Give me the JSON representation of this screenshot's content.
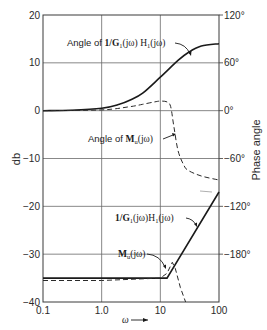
{
  "chart_data": {
    "type": "line",
    "title": "",
    "xlabel": "ω →",
    "ylabel": "db",
    "y2label": "Phase angle",
    "xscale": "log",
    "xlim": [
      0.1,
      100
    ],
    "ylim": [
      -40,
      20
    ],
    "y2lim": [
      -240,
      120
    ],
    "grid": true,
    "x_ticks": [
      "0.1",
      "1.0",
      "10",
      "100"
    ],
    "x_tick_values": [
      0.1,
      1,
      10,
      100
    ],
    "y_ticks": [
      "20",
      "10",
      "0",
      "−10",
      "−20",
      "−30",
      "−40"
    ],
    "y_tick_values": [
      20,
      10,
      0,
      -10,
      -20,
      -30,
      -40
    ],
    "y2_ticks": [
      "120°",
      "60°",
      "0°",
      "−60°",
      "−120°",
      "−180°"
    ],
    "y2_tick_values": [
      120,
      60,
      0,
      -60,
      -120,
      -180
    ],
    "series": [
      {
        "name": "Angle of 1/G1(jω) H1(jω)",
        "axis": "right",
        "units": "deg",
        "style": "solid",
        "x": [
          0.1,
          0.3,
          1,
          2,
          3,
          5,
          10,
          20,
          30,
          50,
          100
        ],
        "values": [
          0,
          0.5,
          3,
          8,
          13,
          22,
          42,
          63,
          73,
          81,
          84
        ]
      },
      {
        "name": "Angle of Mu(jω)",
        "axis": "right",
        "units": "deg",
        "style": "dashed",
        "x": [
          0.1,
          1,
          3,
          5,
          8,
          10,
          13,
          15,
          17,
          20,
          25,
          30,
          50,
          100
        ],
        "values": [
          0,
          1,
          5,
          8,
          11,
          12,
          11,
          5,
          -20,
          -50,
          -68,
          -75,
          -82,
          -87
        ]
      },
      {
        "name": "1/G1(jω) H1(jω)",
        "axis": "left",
        "units": "db",
        "style": "solid",
        "x": [
          0.1,
          1,
          10,
          13,
          100
        ],
        "values": [
          -35,
          -35,
          -35,
          -35,
          -17
        ]
      },
      {
        "name": "Mu(jω)",
        "axis": "left",
        "units": "db",
        "style": "dashed",
        "x": [
          0.1,
          1,
          10,
          13,
          16,
          18,
          22,
          27
        ],
        "values": [
          -35.5,
          -35.5,
          -35,
          -34,
          -31.7,
          -33,
          -37,
          -40
        ]
      }
    ],
    "annotations": [
      {
        "text": "Angle of 1/G1(jω) H1(jω)",
        "points_to_series": 0
      },
      {
        "text": "Angle of Mu(jω)",
        "points_to_series": 1
      },
      {
        "text": "1/G1(jω) H1(jω)",
        "points_to_series": 2
      },
      {
        "text": "Mu(jω)",
        "points_to_series": 3
      }
    ]
  },
  "labels": {
    "angle_g1h1_prefix": "Angle of ",
    "angle_g1h1_expr": "1/G",
    "angle_g1h1_sub1": "1",
    "angle_g1h1_mid": "(jω) H",
    "angle_g1h1_sub2": "1",
    "angle_g1h1_end": "(jω)",
    "angle_mu_prefix": "Angle of ",
    "angle_mu_expr": "M",
    "angle_mu_sub": "u",
    "angle_mu_end": "(jω)",
    "mag_g1h1_expr": "1/G",
    "mag_g1h1_sub1": "1",
    "mag_g1h1_mid": "(jω)H",
    "mag_g1h1_sub2": "1",
    "mag_g1h1_end": "(jω)",
    "mag_mu_expr": "M",
    "mag_mu_sub": "u",
    "mag_mu_end": "(jω)",
    "x_axis_label": "ω",
    "y_axis_label": "db",
    "y2_axis_label": "Phase angle"
  }
}
